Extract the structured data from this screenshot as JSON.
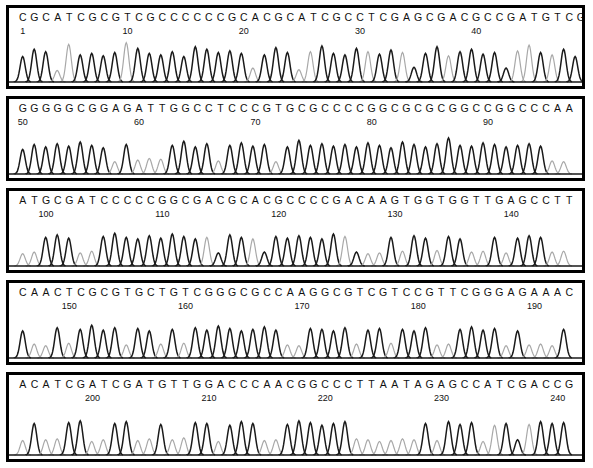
{
  "document": {
    "type": "dna-sequencing-chromatogram",
    "title": "DNA Sequencing Electropherogram",
    "panel_count": 5,
    "total_bases": 241,
    "colors": {
      "background": "#ffffff",
      "border": "#000000",
      "text": "#111111",
      "trace_dark": "#1a1a1a",
      "trace_light": "#a8a8a8"
    }
  },
  "chart_data": {
    "type": "line",
    "xlabel": "Base position",
    "ylabel": "Fluorescence intensity",
    "grid": false,
    "legend": "none",
    "panels": [
      {
        "index": 1,
        "sequence": "CGCATCGCGTCGCCCCCCGCACGCATCGCCTCGAGCGACGCCGATGTCG",
        "start": 1,
        "end": 49,
        "ticks": [
          1,
          10,
          20,
          30,
          40
        ],
        "peak_heights": [
          0.62,
          0.8,
          0.74,
          0.28,
          0.92,
          0.66,
          0.7,
          0.64,
          0.72,
          0.96,
          0.82,
          0.7,
          0.66,
          0.74,
          0.62,
          0.86,
          0.8,
          0.72,
          0.76,
          0.7,
          0.34,
          0.66,
          0.84,
          0.72,
          0.3,
          0.74,
          0.88,
          0.7,
          0.66,
          0.82,
          0.74,
          0.68,
          0.78,
          0.72,
          0.36,
          0.7,
          0.86,
          0.64,
          0.74,
          0.8,
          0.68,
          0.72,
          0.34,
          0.76,
          0.9,
          0.72,
          0.66,
          0.8,
          0.62
        ]
      },
      {
        "index": 2,
        "sequence": "GGGGGCGGAGATTGGCCTCCCGTGCGCCCCGGCGCGCGGCCGGCCCAA",
        "start": 50,
        "end": 97,
        "ticks": [
          50,
          60,
          70,
          80,
          90
        ],
        "peak_heights": [
          0.6,
          0.72,
          0.66,
          0.74,
          0.68,
          0.78,
          0.7,
          0.64,
          0.3,
          0.72,
          0.34,
          0.38,
          0.36,
          0.7,
          0.8,
          0.66,
          0.74,
          0.32,
          0.7,
          0.76,
          0.68,
          0.72,
          0.3,
          0.66,
          0.82,
          0.7,
          0.74,
          0.68,
          0.72,
          0.66,
          0.76,
          0.7,
          0.64,
          0.78,
          0.72,
          0.66,
          0.74,
          0.88,
          0.7,
          0.68,
          0.76,
          0.72,
          0.66,
          0.7,
          0.74,
          0.68,
          0.32,
          0.3
        ]
      },
      {
        "index": 3,
        "sequence": "ATGCGATCCCCCGGCGACGCACGCCCCGACAAGTGGTGGTTGAGCCTT",
        "start": 98,
        "end": 145,
        "ticks": [
          100,
          110,
          120,
          130,
          140
        ],
        "peak_heights": [
          0.3,
          0.34,
          0.7,
          0.76,
          0.68,
          0.32,
          0.36,
          0.72,
          0.8,
          0.7,
          0.66,
          0.74,
          0.68,
          0.78,
          0.72,
          0.66,
          0.7,
          0.32,
          0.76,
          0.7,
          0.66,
          0.34,
          0.72,
          0.68,
          0.74,
          0.7,
          0.66,
          0.78,
          0.72,
          0.34,
          0.3,
          0.32,
          0.7,
          0.36,
          0.74,
          0.68,
          0.38,
          0.72,
          0.66,
          0.34,
          0.36,
          0.7,
          0.32,
          0.68,
          0.74,
          0.7,
          0.34,
          0.36
        ]
      },
      {
        "index": 4,
        "sequence": "CAACTCGCGTGCTGTCGGGCGCCAAGGCGTCGTCCGTTCGGGAGAAAC",
        "start": 146,
        "end": 193,
        "ticks": [
          150,
          160,
          170,
          180,
          190
        ],
        "peak_heights": [
          0.66,
          0.34,
          0.3,
          0.74,
          0.36,
          0.7,
          0.8,
          0.68,
          0.74,
          0.32,
          0.72,
          0.66,
          0.34,
          0.7,
          0.36,
          0.74,
          0.68,
          0.78,
          0.72,
          0.66,
          0.7,
          0.76,
          0.68,
          0.32,
          0.3,
          0.72,
          0.7,
          0.66,
          0.74,
          0.34,
          0.68,
          0.72,
          0.36,
          0.7,
          0.66,
          0.74,
          0.32,
          0.34,
          0.7,
          0.76,
          0.68,
          0.72,
          0.3,
          0.66,
          0.32,
          0.34,
          0.3,
          0.7
        ]
      },
      {
        "index": 5,
        "sequence": "ACATCGATCGATGTTGGACCCAACGGCCCTTAATAGAGCCATCGACCG",
        "start": 194,
        "end": 241,
        "ticks": [
          200,
          210,
          220,
          230,
          240
        ],
        "peak_heights": [
          0.32,
          0.7,
          0.34,
          0.36,
          0.72,
          0.76,
          0.3,
          0.34,
          0.7,
          0.74,
          0.32,
          0.36,
          0.68,
          0.34,
          0.38,
          0.72,
          0.7,
          0.3,
          0.66,
          0.74,
          0.7,
          0.32,
          0.34,
          0.68,
          0.76,
          0.72,
          0.66,
          0.7,
          0.74,
          0.36,
          0.34,
          0.3,
          0.32,
          0.36,
          0.34,
          0.7,
          0.32,
          0.74,
          0.68,
          0.72,
          0.3,
          0.66,
          0.7,
          0.34,
          0.68,
          0.74,
          0.7,
          0.72
        ]
      }
    ]
  }
}
